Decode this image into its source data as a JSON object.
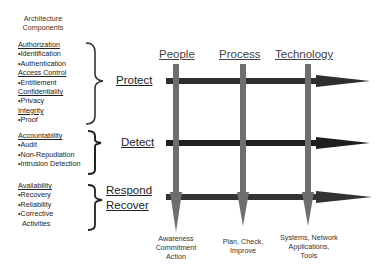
{
  "title": {
    "line1": "Architecture",
    "line2": "Components"
  },
  "groups": [
    {
      "items": [
        {
          "text": "Authorization",
          "type": "heading"
        },
        {
          "text": "•Identification",
          "type": "bullet"
        },
        {
          "text": "•Authentication",
          "type": "bullet"
        },
        {
          "text": "Access Control",
          "type": "heading"
        },
        {
          "text": "•Entitlement",
          "type": "bullet"
        },
        {
          "text": "Confidentiality",
          "type": "heading"
        },
        {
          "text": "•Privacy",
          "type": "bullet"
        },
        {
          "text": "Integrity",
          "type": "heading"
        },
        {
          "text": "•Proof",
          "type": "bullet"
        }
      ],
      "phase": {
        "line1": "Protect"
      }
    },
    {
      "items": [
        {
          "text": "Accountability",
          "type": "heading"
        },
        {
          "text": "•Audit",
          "type": "bullet"
        },
        {
          "text": "•Non-Repudiation",
          "type": "bullet"
        },
        {
          "text": "•Intrusion Detection",
          "type": "bullet"
        }
      ],
      "phase": {
        "line1": "Detect"
      }
    },
    {
      "items": [
        {
          "text": "Availability",
          "type": "heading"
        },
        {
          "text": "•Recovery",
          "type": "bullet"
        },
        {
          "text": "•Reliability",
          "type": "bullet"
        },
        {
          "text": "•Corrective",
          "type": "bullet"
        },
        {
          "text": "Activities",
          "type": "cont"
        }
      ],
      "phase": {
        "line1": "Respond",
        "line2": "Recover"
      }
    }
  ],
  "columns": [
    {
      "label": "People",
      "bottom": [
        "Awareness",
        "Commitment",
        "Action"
      ]
    },
    {
      "label": "Process",
      "bottom": [
        "Plan, Check,",
        "Improve"
      ]
    },
    {
      "label": "Technology",
      "bottom": [
        "Systems, Network",
        "Applications,",
        "Tools"
      ]
    }
  ],
  "colors": {
    "horizontal_arrow": "#2f2f2f",
    "vertical_arrow": "#6e6e6e",
    "brace": "#333333"
  }
}
